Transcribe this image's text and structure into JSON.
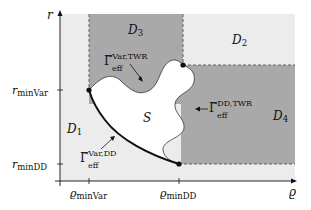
{
  "diagram": {
    "axes": {
      "y_label": "r",
      "x_label": "ϱ",
      "y_ticks": [
        {
          "main": "r",
          "sub": "minVar"
        },
        {
          "main": "r",
          "sub": "minDD"
        }
      ],
      "x_ticks": [
        {
          "main": "ϱ",
          "sub": "minVar"
        },
        {
          "main": "ϱ",
          "sub": "minDD"
        }
      ]
    },
    "regions": {
      "d1": {
        "main": "D",
        "sub": "1"
      },
      "d2": {
        "main": "D",
        "sub": "2"
      },
      "d3": {
        "main": "D",
        "sub": "3"
      },
      "d4": {
        "main": "D",
        "sub": "4"
      },
      "s": "S"
    },
    "boundaries": {
      "var_twr": {
        "main": "Γ̃",
        "sub": "eff",
        "sup": "Var,TWR"
      },
      "dd_twr": {
        "main": "Γ̃",
        "sub": "eff",
        "sup": "DD,TWR"
      },
      "var_dd": {
        "main": "Γ̃",
        "sub": "eff",
        "sup": "Var,DD"
      }
    },
    "colors": {
      "light_region": "#ececec",
      "dark_region": "#a9a9a9",
      "set_s": "#ffffff",
      "lines": "#111111"
    }
  }
}
